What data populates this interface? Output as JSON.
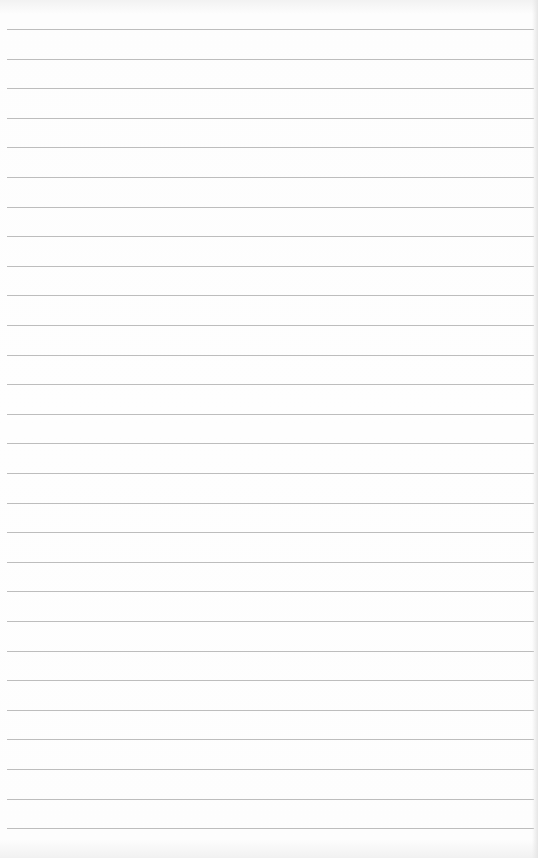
{
  "page": {
    "type": "blank ruled paper",
    "line_count": 28,
    "first_line_y": 29,
    "line_spacing": 29.6,
    "line_color": "#bdbdbd",
    "paper_color": "#fefefe"
  }
}
